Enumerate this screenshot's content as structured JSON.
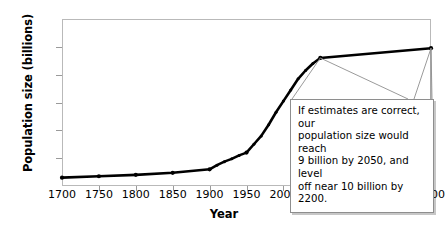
{
  "chart_data": {
    "type": "line",
    "title": "",
    "xlabel": "Year",
    "ylabel": "Population size (billions)",
    "xlim": [
      1700,
      2200
    ],
    "ylim": [
      0,
      12
    ],
    "xticks": [
      1700,
      1750,
      1800,
      1850,
      1900,
      1950,
      2000,
      2050,
      2100,
      2150,
      2200
    ],
    "yticks": [
      0,
      2,
      4,
      6,
      8,
      10,
      12
    ],
    "grid": false,
    "legend": null,
    "x": [
      1700,
      1750,
      1800,
      1850,
      1900,
      1910,
      1920,
      1930,
      1940,
      1950,
      1960,
      1970,
      1980,
      1990,
      2000,
      2010,
      2020,
      2030,
      2040,
      2050,
      2200
    ],
    "values": [
      0.6,
      0.7,
      0.8,
      0.95,
      1.2,
      1.5,
      1.75,
      1.95,
      2.2,
      2.4,
      3.0,
      3.6,
      4.4,
      5.3,
      6.1,
      6.9,
      7.7,
      8.3,
      8.8,
      9.2,
      9.9
    ],
    "series": [
      {
        "name": "World population",
        "values": [
          0.6,
          0.7,
          0.8,
          0.95,
          1.2,
          1.5,
          1.75,
          1.95,
          2.2,
          2.4,
          3.0,
          3.6,
          4.4,
          5.3,
          6.1,
          6.9,
          7.7,
          8.3,
          8.8,
          9.2,
          9.9
        ]
      }
    ],
    "annotations": [
      {
        "text": "If estimates are correct, our population size would reach 9 billion by 2050, and level off near 10 billion by 2200.",
        "points_to": [
          2050,
          2200
        ]
      }
    ],
    "line_color": "#000000",
    "marker_color": "#000000",
    "axis_color": "#b9b9b9"
  },
  "annotation": {
    "lines": [
      "If estimates are correct, our",
      "population size would reach",
      "9 billion by 2050, and level",
      "off near 10 billion by 2200."
    ]
  }
}
